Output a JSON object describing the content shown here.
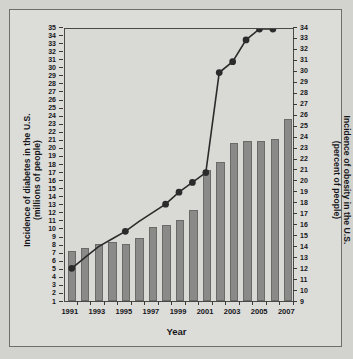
{
  "figure": {
    "background_color": "#d2d2ce",
    "plot_background_color": "#d9d9d5",
    "bar_color": "#8a8a88",
    "line_color": "#2b2b2b"
  },
  "chart_data": {
    "type": "bar",
    "title": "",
    "xlabel": "Year",
    "ylabel": "Incidence of diabetes in the U.S. (millions of people)",
    "ylabel_line1": "Incidence of diabetes in the U.S.",
    "ylabel_line2": "(millions of people)",
    "y2label": "Incidence of obesity in the U.S. (percent of people)",
    "y2label_line1": "Incidence of obesity in the U.S.",
    "y2label_line2": "(percent of people)",
    "grid": false,
    "legend_position": "none",
    "categories": [
      1991,
      1992,
      1993,
      1994,
      1995,
      1996,
      1997,
      1998,
      1999,
      2000,
      2001,
      2002,
      2003,
      2004,
      2005,
      2006,
      2007
    ],
    "x_tick_labels": [
      "1991",
      "1993",
      "1995",
      "1997",
      "1999",
      "2001",
      "2003",
      "2005",
      "2007"
    ],
    "x_tick_years": [
      1991,
      1993,
      1995,
      1997,
      1999,
      2001,
      2003,
      2005,
      2007
    ],
    "ylim": [
      1,
      35
    ],
    "y_ticks": [
      1,
      2,
      3,
      4,
      5,
      6,
      7,
      8,
      9,
      10,
      11,
      12,
      13,
      14,
      15,
      16,
      17,
      18,
      19,
      20,
      21,
      22,
      23,
      24,
      25,
      26,
      27,
      28,
      29,
      30,
      31,
      32,
      33,
      34,
      35
    ],
    "y2lim": [
      9,
      34
    ],
    "y2_ticks": [
      9,
      10,
      11,
      12,
      13,
      14,
      15,
      16,
      17,
      18,
      19,
      20,
      21,
      22,
      23,
      24,
      25,
      26,
      27,
      28,
      29,
      30,
      31,
      32,
      33,
      34
    ],
    "series": [
      {
        "name": "Incidence of diabetes in the U.S. (millions of people)",
        "type": "bar",
        "axis": "left",
        "x": [
          1991,
          1992,
          1993,
          1994,
          1995,
          1996,
          1997,
          1998,
          1999,
          2000,
          2001,
          2002,
          2003,
          2004,
          2005,
          2006,
          2007
        ],
        "values": [
          7.2,
          7.6,
          8.1,
          8.3,
          8.1,
          8.8,
          10.2,
          10.4,
          11.1,
          12.3,
          17.3,
          18.3,
          20.6,
          20.9,
          20.9,
          21.1,
          23.6
        ]
      },
      {
        "name": "Incidence of obesity in the U.S. (percent of people)",
        "type": "line",
        "axis": "right",
        "x": [
          1991,
          1992,
          1993,
          1994,
          1995,
          1996,
          1997,
          1998,
          1999,
          2000,
          2001,
          2002,
          2003,
          2004,
          2005,
          2006
        ],
        "values": [
          12.0,
          13.0,
          14.0,
          14.7,
          15.4,
          16.3,
          17.1,
          17.9,
          19.0,
          19.9,
          20.8,
          30.0,
          31.0,
          33.0,
          34.0,
          34.0
        ],
        "marker_years": [
          1991,
          1995,
          1998,
          1999,
          2000,
          2001,
          2002,
          2003,
          2004,
          2005,
          2006
        ]
      }
    ]
  }
}
